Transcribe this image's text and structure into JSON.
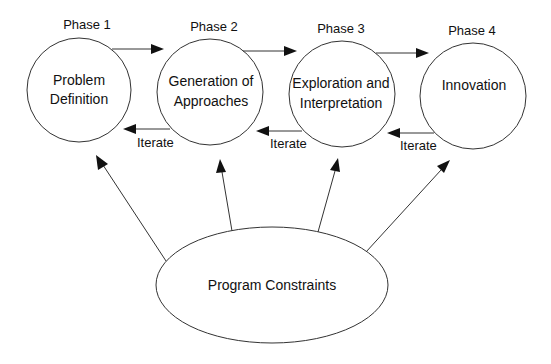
{
  "diagram": {
    "phases": [
      {
        "label": "Phase 1",
        "node_lines": [
          "Problem",
          "Definition"
        ]
      },
      {
        "label": "Phase 2",
        "node_lines": [
          "Generation of",
          "Approaches"
        ]
      },
      {
        "label": "Phase 3",
        "node_lines": [
          "Exploration and",
          "Interpretation"
        ]
      },
      {
        "label": "Phase 4",
        "node_lines": [
          "Innovation"
        ]
      }
    ],
    "iterate_labels": [
      "Iterate",
      "Iterate",
      "Iterate"
    ],
    "constraints": {
      "label": "Program Constraints"
    },
    "colors": {
      "stroke": "#333333",
      "text": "#111111",
      "background": "#ffffff"
    }
  }
}
